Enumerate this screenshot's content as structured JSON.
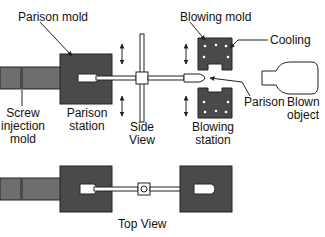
{
  "labels": {
    "parison_mold": "Parison mold",
    "blowing_mold": "Blowing mold",
    "cooling": "Cooling",
    "screw_injection_mold": [
      "Screw",
      "injection",
      "mold"
    ],
    "parison_station": [
      "Parison",
      "station"
    ],
    "side_view": [
      "Side",
      "View"
    ],
    "blowing_station": [
      "Blowing",
      "station"
    ],
    "parison": "Parison",
    "blown_object": [
      "Blown",
      "object"
    ],
    "top_view": "Top View"
  },
  "colors": {
    "mold_fill": "#4a4a4a",
    "screw_fill": "#6e6e6e",
    "line": "#222222",
    "background": "#ffffff"
  }
}
